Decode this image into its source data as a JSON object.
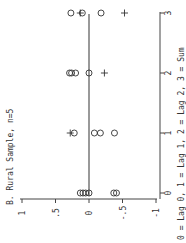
{
  "chart_data": {
    "type": "scatter",
    "orientation": "rotated-90-ccw",
    "title": "B. Rural Sample, n=5",
    "xlabel": "0 = Lag 0, 1 = Lag 1, 2 = Lag 2, 3 = Sum",
    "ylabel": "",
    "categories": [
      "0",
      "1",
      "2",
      "3"
    ],
    "category_meaning": [
      "Lag 0",
      "Lag 1",
      "Lag 2",
      "Sum"
    ],
    "yticks": [
      "1",
      ".5",
      "0",
      "-.5",
      "-1"
    ],
    "ytick_values": [
      1,
      0.5,
      0,
      -0.5,
      -1
    ],
    "ylim": [
      -1,
      1
    ],
    "reference_line": 0,
    "series": [
      {
        "name": "circles",
        "marker": "o",
        "points": [
          {
            "x": 0,
            "y": 0.13
          },
          {
            "x": 0,
            "y": 0.09
          },
          {
            "x": 0,
            "y": 0.05
          },
          {
            "x": 0,
            "y": 0.0
          },
          {
            "x": 0,
            "y": -0.37
          },
          {
            "x": 0,
            "y": -0.41
          },
          {
            "x": 1,
            "y": 0.22
          },
          {
            "x": 1,
            "y": -0.08
          },
          {
            "x": 1,
            "y": -0.17
          },
          {
            "x": 1,
            "y": -0.38
          },
          {
            "x": 2,
            "y": 0.29
          },
          {
            "x": 2,
            "y": 0.26
          },
          {
            "x": 2,
            "y": 0.2
          },
          {
            "x": 2,
            "y": 0.0
          },
          {
            "x": 3,
            "y": 0.27
          },
          {
            "x": 3,
            "y": 0.1
          },
          {
            "x": 3,
            "y": -0.18
          }
        ]
      },
      {
        "name": "plus",
        "marker": "+",
        "points": [
          {
            "x": 1,
            "y": 0.28
          },
          {
            "x": 2,
            "y": -0.23
          },
          {
            "x": 3,
            "y": 0.13
          },
          {
            "x": 3,
            "y": -0.53
          }
        ]
      }
    ],
    "grid": false,
    "legend": null
  }
}
